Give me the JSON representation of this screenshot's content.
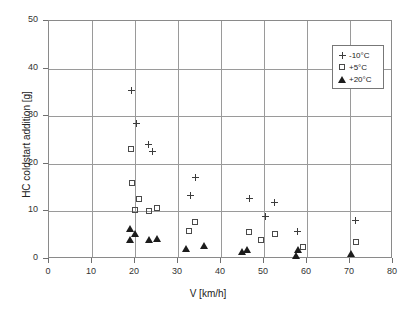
{
  "chart_data": {
    "type": "scatter",
    "title": "",
    "xlabel": "V [km/h]",
    "ylabel": "HC coldstart addition [g]",
    "xlim": [
      0,
      80
    ],
    "ylim": [
      0,
      50
    ],
    "xticks": [
      0,
      10,
      20,
      30,
      40,
      50,
      60,
      70,
      80
    ],
    "yticks": [
      0,
      10,
      20,
      30,
      40,
      50
    ],
    "grid": true,
    "legend_position": "top-right",
    "series": [
      {
        "name": "-10°C",
        "marker": "plus",
        "color": "#3c3c3c",
        "points": [
          [
            19.3,
            35.5
          ],
          [
            20.4,
            28.5
          ],
          [
            23.2,
            24.0
          ],
          [
            24.1,
            22.6
          ],
          [
            34.0,
            17.2
          ],
          [
            33.0,
            13.3
          ],
          [
            46.6,
            12.8
          ],
          [
            52.4,
            11.9
          ],
          [
            50.3,
            8.9
          ],
          [
            57.8,
            5.8
          ],
          [
            71.3,
            8.1
          ]
        ]
      },
      {
        "name": "+5°C",
        "marker": "square",
        "color": "#4a4a4a",
        "points": [
          [
            19.1,
            23.2
          ],
          [
            19.4,
            15.9
          ],
          [
            21.0,
            12.7
          ],
          [
            19.9,
            10.3
          ],
          [
            23.3,
            10.1
          ],
          [
            25.0,
            10.7
          ],
          [
            33.9,
            7.7
          ],
          [
            32.6,
            5.9
          ],
          [
            46.6,
            5.6
          ],
          [
            49.2,
            4.0
          ],
          [
            52.5,
            5.2
          ],
          [
            59.0,
            2.5
          ],
          [
            71.5,
            3.5
          ]
        ]
      },
      {
        "name": "+20°C",
        "marker": "triangle",
        "color": "#1c1c1c",
        "points": [
          [
            18.9,
            6.5
          ],
          [
            18.8,
            4.2
          ],
          [
            20.1,
            5.3
          ],
          [
            23.2,
            4.0
          ],
          [
            25.1,
            4.3
          ],
          [
            31.8,
            2.3
          ],
          [
            36.0,
            2.9
          ],
          [
            44.9,
            1.5
          ],
          [
            46.1,
            2.1
          ],
          [
            57.4,
            0.8
          ],
          [
            57.9,
            1.9
          ],
          [
            70.3,
            1.2
          ]
        ]
      }
    ]
  }
}
